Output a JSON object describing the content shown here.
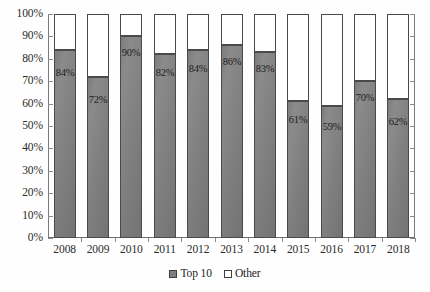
{
  "chart_data": {
    "type": "bar",
    "subtype": "100% stacked column",
    "title": "",
    "subtitle": "",
    "xlabel": "",
    "ylabel": "",
    "categories": [
      "2008",
      "2009",
      "2010",
      "2011",
      "2012",
      "2013",
      "2014",
      "2015",
      "2016",
      "2017",
      "2018"
    ],
    "series": [
      {
        "name": "Top 10",
        "color": "#7f7f7f",
        "values": [
          84,
          72,
          90,
          82,
          84,
          86,
          83,
          61,
          59,
          70,
          62
        ],
        "data_labels": [
          "84%",
          "72%",
          "90%",
          "82%",
          "84%",
          "86%",
          "83%",
          "61%",
          "59%",
          "70%",
          "62%"
        ]
      },
      {
        "name": "Other",
        "color": "#ffffff",
        "values": [
          16,
          28,
          10,
          18,
          16,
          14,
          17,
          39,
          41,
          30,
          38
        ],
        "data_labels": [
          "",
          "",
          "",
          "",
          "",
          "",
          "",
          "",
          "",
          "",
          ""
        ]
      }
    ],
    "ylim": [
      0,
      100
    ],
    "y_ticks": [
      0,
      10,
      20,
      30,
      40,
      50,
      60,
      70,
      80,
      90,
      100
    ],
    "y_tick_labels": [
      "0%",
      "10%",
      "20%",
      "30%",
      "40%",
      "50%",
      "60%",
      "70%",
      "80%",
      "90%",
      "100%"
    ],
    "grid": false,
    "legend_position": "bottom",
    "legend_entries": [
      "Top 10",
      "Other"
    ]
  },
  "axis": {
    "y_tick_labels": [
      "100%",
      "90%",
      "80%",
      "70%",
      "60%",
      "50%",
      "40%",
      "30%",
      "20%",
      "10%",
      "0%"
    ],
    "x_tick_labels": [
      "2008",
      "2009",
      "2010",
      "2011",
      "2012",
      "2013",
      "2014",
      "2015",
      "2016",
      "2017",
      "2018"
    ]
  },
  "legend": {
    "items": [
      {
        "label": "Top 10",
        "swatch": "filled-gray-swatch"
      },
      {
        "label": "Other",
        "swatch": "white-swatch"
      }
    ]
  },
  "colors": {
    "top10_fill": "#7f7f7f",
    "other_fill": "#ffffff",
    "bar_outline": "#4a4a4a",
    "axis_line": "#7a7a7a",
    "text": "#2b2b2b",
    "background": "#fefefe"
  }
}
